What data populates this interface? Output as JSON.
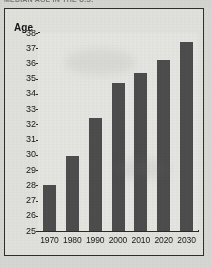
{
  "figure": {
    "clipped_headline": "MEDIAN AGE IN THE U.S.",
    "frame_color": "#2e2e2e",
    "paper_color": "#e2e2de",
    "bar_color": "#4d4d4d"
  },
  "chart_data": {
    "type": "bar",
    "title": "MEDIAN AGE IN THE U.S.",
    "xlabel": "",
    "ylabel": "Age",
    "categories": [
      "1970",
      "1980",
      "1990",
      "2000",
      "2010",
      "2020",
      "2030"
    ],
    "values": [
      28.0,
      29.9,
      32.4,
      34.7,
      35.4,
      36.2,
      37.4
    ],
    "ylim": [
      25,
      38
    ],
    "yticks": [
      25,
      26,
      27,
      28,
      29,
      30,
      31,
      32,
      33,
      34,
      35,
      36,
      37,
      38
    ],
    "ytick_labels": [
      "25",
      "26",
      "27",
      "28",
      "29",
      "30",
      "31",
      "32",
      "33",
      "34",
      "35",
      "36",
      "37",
      "38"
    ],
    "grid": false,
    "legend": null,
    "legend_position": "none"
  }
}
